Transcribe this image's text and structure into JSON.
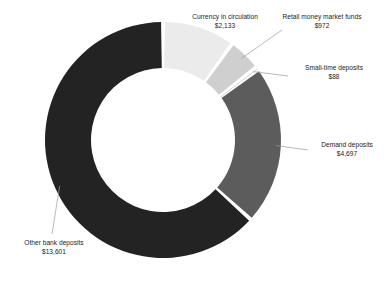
{
  "chart_data": {
    "type": "pie",
    "variant": "donut",
    "title": "",
    "subtitle": "",
    "xlabel": "",
    "ylabel": "",
    "value_prefix": "$",
    "total": 21491,
    "legend": "none",
    "grid": false,
    "start_angle_deg": 0,
    "direction": "clockwise",
    "categories": [
      "Currency in circulation",
      "Retail money market funds",
      "Small-time deposits",
      "Demand deposits",
      "Other bank deposits"
    ],
    "values": [
      2133,
      972,
      88,
      4697,
      13601
    ],
    "value_labels": [
      "$2,133",
      "$972",
      "$88",
      "$4,697",
      "$13,601"
    ],
    "colors": [
      "#ebebeb",
      "#cfcfcf",
      "#9a9a9a",
      "#5c5c5c",
      "#232323"
    ],
    "slices": [
      {
        "label": "Currency in circulation",
        "value": 2133,
        "value_label": "$2,133",
        "color": "#ebebeb",
        "percent": 9.9
      },
      {
        "label": "Retail money market funds",
        "value": 972,
        "value_label": "$972",
        "color": "#cfcfcf",
        "percent": 4.5
      },
      {
        "label": "Small-time deposits",
        "value": 88,
        "value_label": "$88",
        "color": "#9a9a9a",
        "percent": 0.4
      },
      {
        "label": "Demand deposits",
        "value": 4697,
        "value_label": "$4,697",
        "color": "#5c5c5c",
        "percent": 21.9
      },
      {
        "label": "Other bank deposits",
        "value": 13601,
        "value_label": "$13,601",
        "color": "#232323",
        "percent": 63.3
      }
    ]
  },
  "callouts": {
    "currency": {
      "name": "Currency in circulation",
      "value": "$2,133"
    },
    "retail": {
      "name": "Retail money market funds",
      "value": "$972"
    },
    "smalltime": {
      "name": "Small-time deposits",
      "value": "$88"
    },
    "demand": {
      "name": "Demand deposits",
      "value": "$4,697"
    },
    "other": {
      "name": "Other bank deposits",
      "value": "$13,601"
    }
  },
  "style": {
    "background": "#ffffff",
    "text_color": "#1c1c1c",
    "leader_line_color": "#9b9b9b",
    "gap_color": "#ffffff"
  },
  "geometry": {
    "center_x": 163,
    "center_y": 140,
    "outer_radius": 118,
    "inner_radius": 72
  }
}
